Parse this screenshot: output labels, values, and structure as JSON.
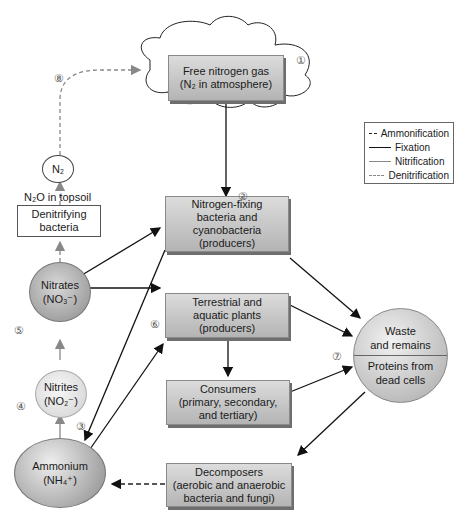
{
  "nodes": {
    "free_nitrogen": {
      "line1": "Free nitrogen gas",
      "line2": "(N₂ in atmosphere)",
      "step": "①"
    },
    "nitrogen_fixing": {
      "line1": "Nitrogen-fixing",
      "line2": "bacteria and",
      "line3": "cyanobacteria",
      "line4": "(producers)",
      "step": "②"
    },
    "plants": {
      "line1": "Terrestrial and",
      "line2": "aquatic plants",
      "line3": "(producers)",
      "step": "⑥"
    },
    "consumers": {
      "line1": "Consumers",
      "line2": "(primary, secondary,",
      "line3": "and tertiary)"
    },
    "decomposers": {
      "line1": "Decomposers",
      "line2": "(aerobic and anaerobic",
      "line3": "bacteria and fungi)"
    },
    "waste": {
      "top1": "Waste",
      "top2": "and remains",
      "bottom1": "Proteins from",
      "bottom2": "dead cells",
      "step": "⑦"
    },
    "ammonium": {
      "line1": "Ammonium",
      "line2": "(NH₄⁺)",
      "step": "③"
    },
    "nitrites": {
      "line1": "Nitrites",
      "line2": "(NO₂⁻)",
      "step": "④"
    },
    "nitrates": {
      "line1": "Nitrates",
      "line2": "(NO₃⁻)",
      "step": "⑤"
    },
    "denitrifying": {
      "line1": "Denitrifying",
      "line2": "bacteria"
    },
    "n2o_label": "N₂O in topsoil",
    "n2": {
      "label": "N₂",
      "step": "⑧"
    }
  },
  "legend": [
    {
      "label": "Ammonification",
      "style": "dashed",
      "color": "#222222"
    },
    {
      "label": "Fixation",
      "style": "solid",
      "color": "#111111"
    },
    {
      "label": "Nitrification",
      "style": "solid",
      "color": "#888888"
    },
    {
      "label": "Denitrification",
      "style": "dashed",
      "color": "#888888"
    }
  ]
}
